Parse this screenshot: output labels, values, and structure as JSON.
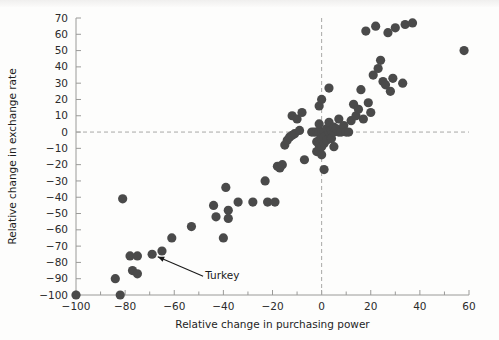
{
  "chart_data": {
    "type": "scatter",
    "title": "",
    "xlabel": "Relative change in purchasing power",
    "ylabel": "Relative change in exchange rate",
    "xlim": [
      -100,
      60
    ],
    "ylim": [
      -100,
      70
    ],
    "xticks": [
      -100,
      -80,
      -60,
      -40,
      -20,
      0,
      20,
      40,
      60
    ],
    "xticklabels": [
      "−100",
      "−80",
      "−60",
      "−40",
      "−20",
      "0",
      "20",
      "40",
      "60"
    ],
    "yticks": [
      -100,
      -90,
      -80,
      -70,
      -60,
      -50,
      -40,
      -30,
      -20,
      -10,
      0,
      10,
      20,
      30,
      40,
      50,
      60,
      70
    ],
    "yticklabels": [
      "−100",
      "−90",
      "−80",
      "−70",
      "−60",
      "−50",
      "−40",
      "−30",
      "−20",
      "−10",
      "0",
      "10",
      "20",
      "30",
      "40",
      "50",
      "60",
      "70"
    ],
    "xminorticks": [
      -90,
      -70,
      -50,
      -30,
      -10,
      10,
      30,
      50
    ],
    "grid": false,
    "legend": false,
    "reference_lines": [
      {
        "orient": "horizontal",
        "value": 0,
        "style": "dashed"
      },
      {
        "orient": "vertical",
        "value": 0,
        "style": "dashed"
      }
    ],
    "marker_color": "#4a4a4a",
    "marker_size": 4.6,
    "annotations": [
      {
        "text": "Turkey",
        "point_x": -69,
        "point_y": -75,
        "label_x": -49,
        "label_y": -88
      }
    ],
    "points": [
      [
        -100,
        -100
      ],
      [
        -84,
        -90
      ],
      [
        -82,
        -100
      ],
      [
        -81,
        -41
      ],
      [
        -78,
        -76
      ],
      [
        -77,
        -85
      ],
      [
        -75,
        -76
      ],
      [
        -75,
        -87
      ],
      [
        -69,
        -75
      ],
      [
        -65,
        -73
      ],
      [
        -61,
        -65
      ],
      [
        -53,
        -58
      ],
      [
        -44,
        -45
      ],
      [
        -43,
        -52
      ],
      [
        -40,
        -65
      ],
      [
        -39,
        -34
      ],
      [
        -38,
        -48
      ],
      [
        -38,
        -53
      ],
      [
        -34,
        -43
      ],
      [
        -28,
        -43
      ],
      [
        -23,
        -30
      ],
      [
        -22,
        -43
      ],
      [
        -19,
        -43
      ],
      [
        -18,
        -21
      ],
      [
        -17,
        -22
      ],
      [
        -16,
        -20
      ],
      [
        -15,
        -8
      ],
      [
        -14,
        -5
      ],
      [
        -13,
        -3
      ],
      [
        -12,
        -2
      ],
      [
        -12,
        10
      ],
      [
        -11,
        -1
      ],
      [
        -10,
        8
      ],
      [
        -9,
        1
      ],
      [
        -8,
        12
      ],
      [
        -7,
        -17
      ],
      [
        -4,
        0
      ],
      [
        -3,
        0
      ],
      [
        -2,
        0
      ],
      [
        -2,
        -6
      ],
      [
        -2,
        -12
      ],
      [
        -1,
        0
      ],
      [
        -1,
        -5
      ],
      [
        -1,
        -8
      ],
      [
        -1,
        -11
      ],
      [
        -1,
        5
      ],
      [
        -1,
        16
      ],
      [
        0,
        0
      ],
      [
        0,
        -4
      ],
      [
        0,
        -9
      ],
      [
        0,
        -14
      ],
      [
        0,
        20
      ],
      [
        1,
        0
      ],
      [
        1,
        -3
      ],
      [
        1,
        -7
      ],
      [
        1,
        -23
      ],
      [
        2,
        2
      ],
      [
        2,
        -5
      ],
      [
        3,
        0
      ],
      [
        3,
        6
      ],
      [
        3,
        27
      ],
      [
        4,
        1
      ],
      [
        4,
        -4
      ],
      [
        5,
        0
      ],
      [
        5,
        3
      ],
      [
        5,
        -9
      ],
      [
        6,
        2
      ],
      [
        7,
        0
      ],
      [
        7,
        8
      ],
      [
        8,
        0
      ],
      [
        9,
        4
      ],
      [
        10,
        0
      ],
      [
        11,
        0
      ],
      [
        12,
        7
      ],
      [
        13,
        17
      ],
      [
        14,
        10
      ],
      [
        15,
        14
      ],
      [
        16,
        26
      ],
      [
        17,
        8
      ],
      [
        18,
        62
      ],
      [
        19,
        18
      ],
      [
        20,
        12
      ],
      [
        21,
        35
      ],
      [
        22,
        65
      ],
      [
        23,
        39
      ],
      [
        24,
        44
      ],
      [
        25,
        31
      ],
      [
        26,
        29
      ],
      [
        27,
        61
      ],
      [
        28,
        25
      ],
      [
        29,
        33
      ],
      [
        30,
        64
      ],
      [
        33,
        30
      ],
      [
        34,
        66
      ],
      [
        37,
        67
      ],
      [
        58,
        50
      ]
    ]
  }
}
